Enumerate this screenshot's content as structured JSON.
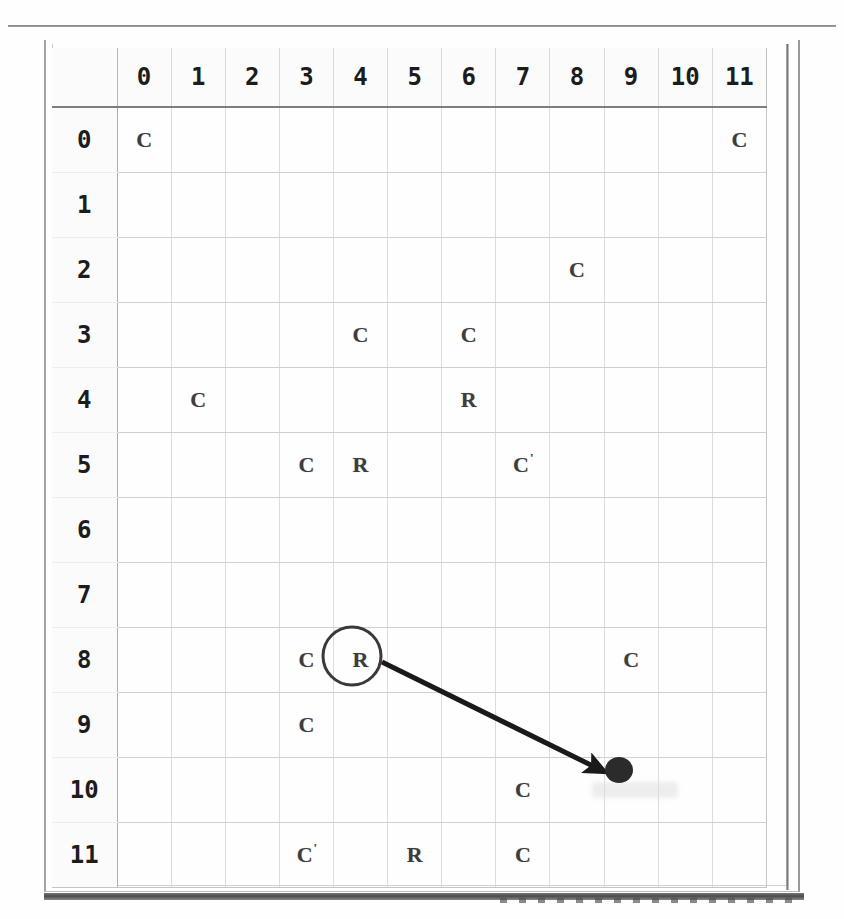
{
  "document": {
    "type": "scanned-grid-worksheet",
    "grid_title_visible": false
  },
  "grid": {
    "column_headers": [
      "0",
      "1",
      "2",
      "3",
      "4",
      "5",
      "6",
      "7",
      "8",
      "9",
      "10",
      "11"
    ],
    "row_headers": [
      "0",
      "1",
      "2",
      "3",
      "4",
      "5",
      "6",
      "7",
      "8",
      "9",
      "10",
      "11"
    ],
    "corner_label": "",
    "rows": [
      [
        "C",
        "",
        "",
        "",
        "",
        "",
        "",
        "",
        "",
        "",
        "",
        "C"
      ],
      [
        "",
        "",
        "",
        "",
        "",
        "",
        "",
        "",
        "",
        "",
        "",
        ""
      ],
      [
        "",
        "",
        "",
        "",
        "",
        "",
        "",
        "",
        "C",
        "",
        "",
        ""
      ],
      [
        "",
        "",
        "",
        "",
        "C",
        "",
        "C",
        "",
        "",
        "",
        "",
        ""
      ],
      [
        "",
        "C",
        "",
        "",
        "",
        "",
        "R",
        "",
        "",
        "",
        "",
        ""
      ],
      [
        "",
        "",
        "",
        "C",
        "R",
        "",
        "",
        "C'",
        "",
        "",
        "",
        ""
      ],
      [
        "",
        "",
        "",
        "",
        "",
        "",
        "",
        "",
        "",
        "",
        "",
        ""
      ],
      [
        "",
        "",
        "",
        "",
        "",
        "",
        "",
        "",
        "",
        "",
        "",
        ""
      ],
      [
        "",
        "",
        "",
        "C",
        "R",
        "",
        "",
        "",
        "",
        "C",
        "",
        ""
      ],
      [
        "",
        "",
        "",
        "C",
        "",
        "",
        "",
        "",
        "",
        "",
        "",
        ""
      ],
      [
        "",
        "",
        "",
        "",
        "",
        "",
        "",
        "C",
        "",
        "",
        "",
        ""
      ],
      [
        "",
        "",
        "",
        "C'",
        "",
        "R",
        "",
        "C",
        "",
        "",
        "",
        ""
      ]
    ]
  },
  "annotations": {
    "circle": {
      "name": "highlight-circle",
      "target_cell": {
        "row": "8",
        "column": "4",
        "value": "R"
      },
      "cx": 352,
      "cy": 656,
      "r": 29,
      "stroke": "#3a3a3a",
      "stroke_width": 3
    },
    "arrow": {
      "name": "pointer-arrow",
      "from": {
        "x": 382,
        "y": 662
      },
      "to": {
        "x": 605,
        "y": 772
      },
      "stroke": "#1a1a1a",
      "stroke_width": 5
    },
    "dot": {
      "name": "target-dot",
      "cx": 619,
      "cy": 770,
      "rx": 14,
      "ry": 13,
      "fill": "#2b2b2b",
      "located_cell": {
        "row": "10",
        "column": "9"
      }
    }
  },
  "colors": {
    "ink": "#2c2c2c",
    "grid_line": "#d4d4d4",
    "header_rule": "#7d7d7d",
    "annotation": "#1a1a1a",
    "page": "#fefefe"
  }
}
